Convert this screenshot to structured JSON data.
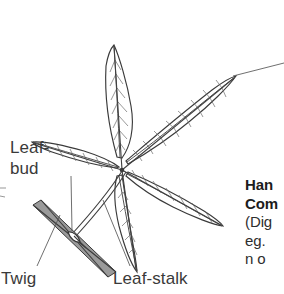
{
  "figure": {
    "leaflet_count": 5,
    "ink_color": "#2b2b2b",
    "line_color": "#4a4a4a",
    "background_color": "#ffffff"
  },
  "labels": {
    "leaf_bud_line1": "Leaf-",
    "leaf_bud_line2": "bud",
    "twig": "Twig",
    "leaf_stalk": "Leaf-stalk"
  },
  "caption": {
    "heading_line1": "Han",
    "heading_line2": "Com",
    "detail_line1": "(Dig",
    "detail_line2": "eg. ",
    "detail_line3": "n o"
  }
}
